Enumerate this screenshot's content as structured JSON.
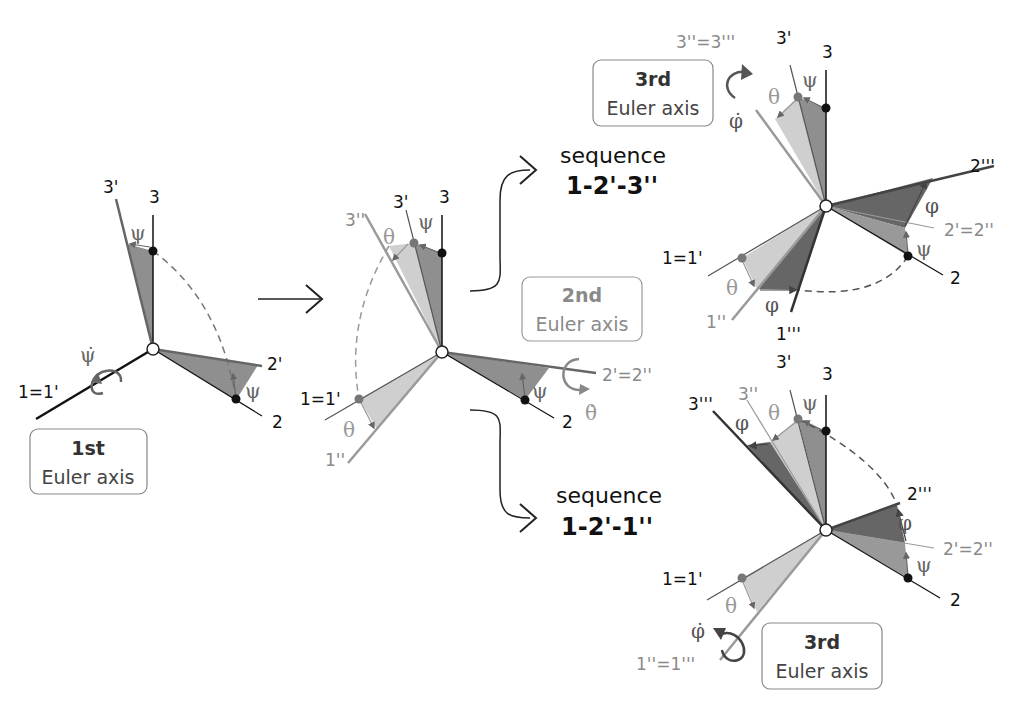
{
  "colors": {
    "axis_black": "#111111",
    "axis_gray": "#9a9a9a",
    "psi_fill": "#8f8f8f",
    "theta_fill": "#cfcfcf",
    "phi_fill": "#666666",
    "label_gray": "#8a8a8a"
  },
  "diagram1": {
    "label_3prime": "3'",
    "label_3": "3",
    "label_psi_top": "ψ",
    "label_psi_right": "ψ",
    "label_2prime": "2'",
    "label_2": "2",
    "label_1eq1prime": "1=1'",
    "label_psidot": "ψ̇",
    "box_line1": "1st",
    "box_line2": "Euler axis"
  },
  "diagram2": {
    "label_3prime": "3'",
    "label_3": "3",
    "label_3dprime": "3''",
    "label_theta_top": "θ",
    "label_psi_top": "ψ",
    "label_1eq1prime": "1=1'",
    "label_theta_bottom": "θ",
    "label_1dprime": "1''",
    "label_psi_right": "ψ",
    "label_2": "2",
    "label_2eq": "2'=2''",
    "label_thetadot": "θ̇",
    "box_line1": "2nd",
    "box_line2": "Euler axis"
  },
  "sequence_top": {
    "word": "sequence",
    "name": "1-2'-3''"
  },
  "sequence_bottom": {
    "word": "sequence",
    "name": "1-2'-1''"
  },
  "diagram3_top": {
    "label_3eq": "3''=3'''",
    "label_3prime": "3'",
    "label_3": "3",
    "label_psi_top": "ψ",
    "label_theta_top": "θ",
    "label_phidot": "φ̇",
    "label_2triple": "2'''",
    "label_phi_right": "φ",
    "label_2eq": "2'=2''",
    "label_psi_right": "ψ",
    "label_2": "2",
    "label_1eq1prime": "1=1'",
    "label_theta_bottom": "θ",
    "label_1dprime": "1''",
    "label_phi_bottom": "φ",
    "label_1triple": "1'''",
    "box_line1": "3rd",
    "box_line2": "Euler axis"
  },
  "diagram3_bottom": {
    "label_3prime": "3'",
    "label_3": "3",
    "label_3triple": "3'''",
    "label_3dprime": "3''",
    "label_phi_top": "φ",
    "label_theta_top": "θ",
    "label_psi_top": "ψ",
    "label_2triple": "2'''",
    "label_phi_right": "φ",
    "label_2eq": "2'=2''",
    "label_psi_right": "ψ",
    "label_2": "2",
    "label_1eq1prime": "1=1'",
    "label_theta_bottom": "θ",
    "label_phidot": "φ̇",
    "label_1eq": "1''=1'''",
    "box_line1": "3rd",
    "box_line2": "Euler axis"
  }
}
